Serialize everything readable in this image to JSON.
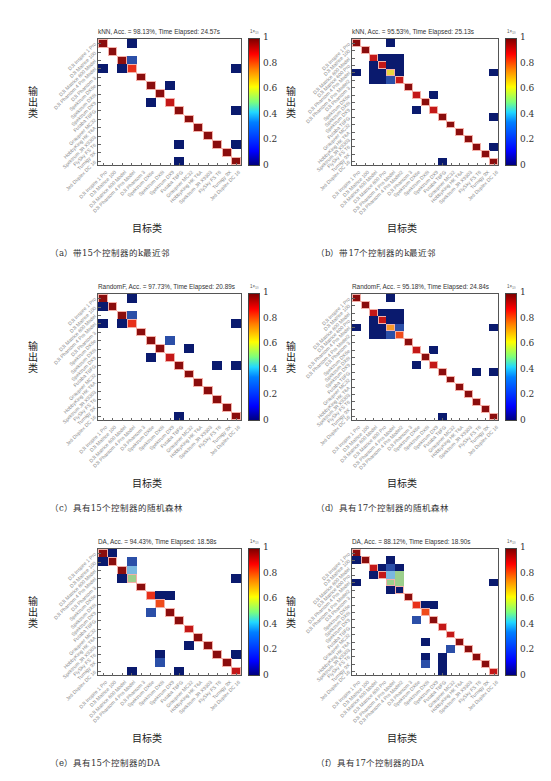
{
  "colorbar": {
    "ticks": [
      "1",
      "0.8",
      "0.6",
      "0.4",
      "0.2",
      "0"
    ],
    "unit": "1×₁₀"
  },
  "axis": {
    "x_label": "目标类",
    "y_label": "输出类"
  },
  "colors": {
    "diag_dark": "#8b0d0d",
    "diag_mid": "#c41818",
    "diag_light": "#e8301a",
    "orange_red": "#f04b1a",
    "orange": "#f59a2a",
    "yellow": "#e8d640",
    "light_blue": "#7ab8e0",
    "light_green": "#9ccf8c",
    "mid_blue": "#2b4fa8",
    "dark_blue": "#0a1a6e"
  },
  "labels15": [
    "DJI Inspire 1 Pro",
    "DJI Matrice 100",
    "DJI Matrice 600 Model",
    "DJI Phantom 4 Pro Model",
    "DJI Phantom 3",
    "Spektrum DX6e",
    "Spektrum DX6i",
    "Spektrum DX9",
    "Futaba T8FG",
    "Graupner MC32",
    "HobbyKing HK T6A",
    "Spektrum JR X9303",
    "FlySky FS T6",
    "Turnigy 9X",
    "Jeti Duplex DC 16"
  ],
  "labels17": [
    "DJI Inspire 1 Pro",
    "DJI Matrice 100",
    "DJI Matrice 600 Model",
    "DJI Matrice 600 Pro",
    "DJI Phantom 4 Pro Model",
    "DJI Phantom 4 Pro Model2",
    "DJI Phantom 3",
    "Spektrum DX6e",
    "Spektrum DX6i",
    "Spektrum DX9",
    "Futaba T8FG",
    "Graupner MC32",
    "HobbyKing HK T6A",
    "Spektrum JR X9303",
    "FlySky FS T6",
    "Turnigy 9X",
    "Jeti Duplex DC 16"
  ],
  "panels": [
    {
      "id": "a",
      "title": "kNN, Acc. = 98.13%, Time Elapsed: 24.57s",
      "caption": "（a）带15个控制器的k最近邻"
    },
    {
      "id": "b",
      "title": "kNN, Acc. = 95.53%, Time Elapsed: 25.13s",
      "caption": "（b）带17个控制器的k最近邻"
    },
    {
      "id": "c",
      "title": "RandomF, Acc. = 97.73%, Time Elapsed: 20.89s",
      "caption": "（c）具有15个控制器的随机森林"
    },
    {
      "id": "d",
      "title": "RandomF, Acc. = 95.18%, Time Elapsed: 24.84s",
      "caption": "（d）具有17个控制器的随机森林"
    },
    {
      "id": "e",
      "title": "DA, Acc. = 94.43%, Time Elapsed: 18.58s",
      "caption": "（e）具有15个控制器的DA"
    },
    {
      "id": "f",
      "title": "DA, Acc. = 88.12%, Time Elapsed: 18.90s",
      "caption": "（f）具有17个控制器的DA"
    }
  ],
  "chart_data": [
    {
      "type": "heatmap",
      "id": "a",
      "title": "kNN, Acc. = 98.13%, Time Elapsed: 24.57s",
      "xlabel": "目标类",
      "ylabel": "输出类",
      "n_classes": 15,
      "colorbar_range": [
        0,
        1
      ],
      "cells": [
        [
          0,
          0,
          0.95
        ],
        [
          0,
          3,
          0.02
        ],
        [
          1,
          1,
          0.98
        ],
        [
          2,
          2,
          0.95
        ],
        [
          2,
          3,
          0.1
        ],
        [
          3,
          0,
          0.02
        ],
        [
          3,
          2,
          0.02
        ],
        [
          3,
          3,
          0.85
        ],
        [
          3,
          14,
          0.02
        ],
        [
          4,
          4,
          0.99
        ],
        [
          5,
          5,
          0.95
        ],
        [
          5,
          7,
          0.02
        ],
        [
          6,
          6,
          0.99
        ],
        [
          7,
          5,
          0.03
        ],
        [
          7,
          7,
          0.92
        ],
        [
          8,
          8,
          0.97
        ],
        [
          8,
          14,
          0.02
        ],
        [
          9,
          9,
          0.99
        ],
        [
          10,
          10,
          0.99
        ],
        [
          11,
          11,
          0.98
        ],
        [
          12,
          12,
          0.97
        ],
        [
          12,
          8,
          0.02
        ],
        [
          12,
          14,
          0.02
        ],
        [
          13,
          13,
          0.99
        ],
        [
          14,
          8,
          0.02
        ],
        [
          14,
          14,
          0.93
        ]
      ]
    },
    {
      "type": "heatmap",
      "id": "b",
      "title": "kNN, Acc. = 95.53%, Time Elapsed: 25.13s",
      "xlabel": "目标类",
      "ylabel": "输出类",
      "n_classes": 17,
      "colorbar_range": [
        0,
        1
      ],
      "cells": [
        [
          0,
          0,
          0.95
        ],
        [
          0,
          4,
          0.02
        ],
        [
          1,
          1,
          0.98
        ],
        [
          2,
          2,
          0.9
        ],
        [
          2,
          3,
          0.05
        ],
        [
          2,
          4,
          0.05
        ],
        [
          2,
          5,
          0.05
        ],
        [
          3,
          2,
          0.04
        ],
        [
          3,
          3,
          0.88
        ],
        [
          3,
          4,
          0.05
        ],
        [
          3,
          5,
          0.05
        ],
        [
          4,
          0,
          0.02
        ],
        [
          4,
          2,
          0.04
        ],
        [
          4,
          3,
          0.05
        ],
        [
          4,
          4,
          0.62
        ],
        [
          4,
          5,
          0.06
        ],
        [
          4,
          16,
          0.02
        ],
        [
          5,
          2,
          0.04
        ],
        [
          5,
          3,
          0.05
        ],
        [
          5,
          4,
          0.2
        ],
        [
          5,
          5,
          0.88
        ],
        [
          6,
          6,
          0.99
        ],
        [
          7,
          7,
          0.92
        ],
        [
          7,
          9,
          0.02
        ],
        [
          8,
          8,
          0.99
        ],
        [
          9,
          7,
          0.03
        ],
        [
          9,
          9,
          0.92
        ],
        [
          10,
          10,
          0.97
        ],
        [
          10,
          16,
          0.02
        ],
        [
          11,
          11,
          0.99
        ],
        [
          12,
          12,
          0.99
        ],
        [
          13,
          13,
          0.98
        ],
        [
          14,
          14,
          0.97
        ],
        [
          14,
          16,
          0.02
        ],
        [
          15,
          15,
          0.99
        ],
        [
          16,
          10,
          0.02
        ],
        [
          16,
          16,
          0.93
        ]
      ]
    },
    {
      "type": "heatmap",
      "id": "c",
      "title": "RandomF, Acc. = 97.73%, Time Elapsed: 20.89s",
      "xlabel": "目标类",
      "ylabel": "输出类",
      "n_classes": 15,
      "colorbar_range": [
        0,
        1
      ],
      "cells": [
        [
          0,
          0,
          0.95
        ],
        [
          0,
          3,
          0.02
        ],
        [
          1,
          0,
          0.02
        ],
        [
          1,
          1,
          0.98
        ],
        [
          2,
          2,
          0.95
        ],
        [
          2,
          3,
          0.12
        ],
        [
          3,
          0,
          0.02
        ],
        [
          3,
          2,
          0.02
        ],
        [
          3,
          3,
          0.85
        ],
        [
          3,
          14,
          0.02
        ],
        [
          4,
          4,
          0.99
        ],
        [
          5,
          5,
          0.95
        ],
        [
          5,
          7,
          0.1
        ],
        [
          6,
          6,
          0.99
        ],
        [
          6,
          9,
          0.02
        ],
        [
          7,
          5,
          0.03
        ],
        [
          7,
          7,
          0.88
        ],
        [
          8,
          8,
          0.97
        ],
        [
          8,
          12,
          0.02
        ],
        [
          8,
          14,
          0.02
        ],
        [
          9,
          9,
          0.97
        ],
        [
          10,
          10,
          0.99
        ],
        [
          11,
          11,
          0.98
        ],
        [
          12,
          12,
          0.97
        ],
        [
          13,
          13,
          0.99
        ],
        [
          14,
          8,
          0.02
        ],
        [
          14,
          14,
          0.93
        ]
      ]
    },
    {
      "type": "heatmap",
      "id": "d",
      "title": "RandomF, Acc. = 95.18%, Time Elapsed: 24.84s",
      "xlabel": "目标类",
      "ylabel": "输出类",
      "n_classes": 17,
      "colorbar_range": [
        0,
        1
      ],
      "cells": [
        [
          0,
          0,
          0.95
        ],
        [
          0,
          4,
          0.02
        ],
        [
          1,
          1,
          0.98
        ],
        [
          2,
          2,
          0.9
        ],
        [
          2,
          3,
          0.05
        ],
        [
          2,
          4,
          0.05
        ],
        [
          2,
          5,
          0.05
        ],
        [
          3,
          2,
          0.04
        ],
        [
          3,
          3,
          0.88
        ],
        [
          3,
          4,
          0.05
        ],
        [
          3,
          5,
          0.05
        ],
        [
          4,
          0,
          0.02
        ],
        [
          4,
          2,
          0.04
        ],
        [
          4,
          3,
          0.05
        ],
        [
          4,
          4,
          0.7
        ],
        [
          4,
          5,
          0.12
        ],
        [
          4,
          16,
          0.02
        ],
        [
          5,
          2,
          0.04
        ],
        [
          5,
          3,
          0.05
        ],
        [
          5,
          4,
          0.2
        ],
        [
          5,
          5,
          0.78
        ],
        [
          6,
          6,
          0.99
        ],
        [
          7,
          7,
          0.9
        ],
        [
          7,
          9,
          0.02
        ],
        [
          8,
          8,
          0.99
        ],
        [
          9,
          7,
          0.03
        ],
        [
          9,
          9,
          0.88
        ],
        [
          10,
          10,
          0.97
        ],
        [
          10,
          14,
          0.02
        ],
        [
          10,
          16,
          0.02
        ],
        [
          11,
          11,
          0.99
        ],
        [
          12,
          12,
          0.99
        ],
        [
          13,
          13,
          0.98
        ],
        [
          14,
          14,
          0.97
        ],
        [
          15,
          15,
          0.99
        ],
        [
          16,
          10,
          0.02
        ],
        [
          16,
          16,
          0.93
        ]
      ]
    },
    {
      "type": "heatmap",
      "id": "e",
      "title": "DA, Acc. = 94.43%, Time Elapsed: 18.58s",
      "xlabel": "目标类",
      "ylabel": "输出类",
      "n_classes": 15,
      "colorbar_range": [
        0,
        1
      ],
      "cells": [
        [
          0,
          0,
          0.95
        ],
        [
          0,
          1,
          0.02
        ],
        [
          1,
          0,
          0.02
        ],
        [
          1,
          1,
          0.95
        ],
        [
          1,
          3,
          0.12
        ],
        [
          2,
          2,
          0.95
        ],
        [
          2,
          3,
          0.35
        ],
        [
          3,
          2,
          0.02
        ],
        [
          3,
          3,
          0.5
        ],
        [
          3,
          14,
          0.02
        ],
        [
          4,
          4,
          0.99
        ],
        [
          5,
          5,
          0.85
        ],
        [
          5,
          6,
          0.02
        ],
        [
          5,
          7,
          0.02
        ],
        [
          6,
          6,
          0.78
        ],
        [
          7,
          5,
          0.08
        ],
        [
          7,
          7,
          0.95
        ],
        [
          8,
          8,
          0.97
        ],
        [
          9,
          9,
          0.9
        ],
        [
          10,
          10,
          0.99
        ],
        [
          11,
          9,
          0.05
        ],
        [
          11,
          11,
          0.97
        ],
        [
          12,
          6,
          0.03
        ],
        [
          12,
          12,
          0.97
        ],
        [
          12,
          14,
          0.02
        ],
        [
          13,
          6,
          0.1
        ],
        [
          13,
          13,
          0.99
        ],
        [
          14,
          3,
          0.02
        ],
        [
          14,
          8,
          0.02
        ],
        [
          14,
          14,
          0.9
        ]
      ]
    },
    {
      "type": "heatmap",
      "id": "f",
      "title": "DA, Acc. = 88.12%, Time Elapsed: 18.90s",
      "xlabel": "目标类",
      "ylabel": "输出类",
      "n_classes": 17,
      "colorbar_range": [
        0,
        1
      ],
      "cells": [
        [
          0,
          0,
          0.95
        ],
        [
          1,
          0,
          0.02
        ],
        [
          1,
          1,
          0.95
        ],
        [
          1,
          4,
          0.05
        ],
        [
          2,
          2,
          0.92
        ],
        [
          2,
          3,
          0.02
        ],
        [
          2,
          4,
          0.1
        ],
        [
          2,
          5,
          0.05
        ],
        [
          3,
          2,
          0.02
        ],
        [
          3,
          3,
          0.9
        ],
        [
          3,
          4,
          0.35
        ],
        [
          3,
          5,
          0.45
        ],
        [
          4,
          0,
          0.02
        ],
        [
          4,
          4,
          0.42
        ],
        [
          4,
          5,
          0.42
        ],
        [
          4,
          16,
          0.02
        ],
        [
          5,
          4,
          0.05
        ],
        [
          5,
          5,
          0.05
        ],
        [
          6,
          6,
          0.99
        ],
        [
          7,
          7,
          0.85
        ],
        [
          7,
          8,
          0.02
        ],
        [
          7,
          9,
          0.02
        ],
        [
          8,
          8,
          0.75
        ],
        [
          9,
          7,
          0.08
        ],
        [
          9,
          9,
          0.95
        ],
        [
          10,
          10,
          0.9
        ],
        [
          11,
          11,
          0.88
        ],
        [
          12,
          8,
          0.05
        ],
        [
          12,
          12,
          0.97
        ],
        [
          13,
          11,
          0.12
        ],
        [
          13,
          13,
          0.97
        ],
        [
          14,
          8,
          0.05
        ],
        [
          14,
          10,
          0.02
        ],
        [
          14,
          14,
          0.97
        ],
        [
          15,
          8,
          0.15
        ],
        [
          15,
          10,
          0.02
        ],
        [
          15,
          15,
          0.99
        ],
        [
          16,
          10,
          0.02
        ],
        [
          16,
          16,
          0.9
        ]
      ]
    }
  ]
}
